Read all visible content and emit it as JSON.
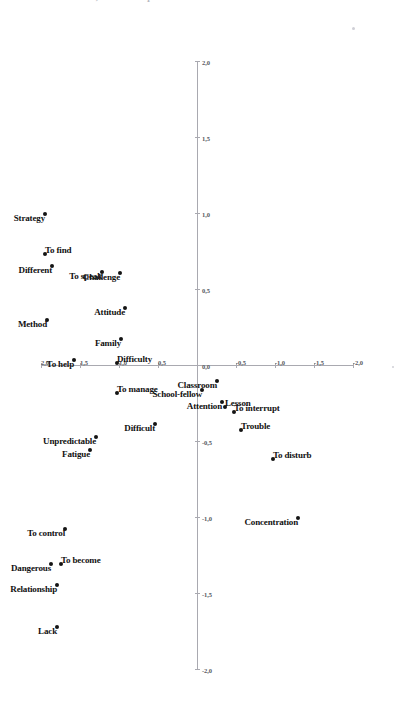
{
  "caption": {
    "text": "xxx. In the ideal, if I could qualified as mindful"
  },
  "chart_data": {
    "type": "scatter",
    "title": "",
    "subtitle": "",
    "xlabel": "",
    "ylabel": "",
    "grid": false,
    "legend": null,
    "xlim": [
      -2.0,
      2.0
    ],
    "ylim": [
      -2.0,
      2.0
    ],
    "xticks": [
      -2.0,
      -1.5,
      -1.0,
      -0.5,
      0.0,
      0.5,
      1.0,
      1.5,
      2.0
    ],
    "yticks": [
      -2.0,
      -1.5,
      -1.0,
      -0.5,
      0.0,
      0.5,
      1.0,
      1.5,
      2.0
    ],
    "xticklabels": [
      "-2,0",
      "-1,5",
      "-1,0",
      "-0,5",
      "0,0",
      "0,5",
      "1,0",
      "1,5",
      "2,0"
    ],
    "yticklabels": [
      "-2,0",
      "-1,5",
      "-1,0",
      "-0,5",
      "0,0",
      "0,5",
      "1,0",
      "1,5",
      "2,0"
    ],
    "points": [
      {
        "label": "Lack",
        "x": -1.72,
        "y": 1.8,
        "side": "left"
      },
      {
        "label": "Relationship",
        "x": -1.44,
        "y": 1.8,
        "side": "left"
      },
      {
        "label": "Dangerous",
        "x": -1.3,
        "y": 1.87,
        "side": "left"
      },
      {
        "label": "To become",
        "x": -1.3,
        "y": 1.74,
        "side": "right"
      },
      {
        "label": "To control",
        "x": -1.07,
        "y": 1.69,
        "side": "left"
      },
      {
        "label": "Fatigue",
        "x": -0.55,
        "y": 1.37,
        "side": "left"
      },
      {
        "label": "Unpredictable",
        "x": -0.47,
        "y": 1.29,
        "side": "left"
      },
      {
        "label": "Difficult",
        "x": -0.38,
        "y": 0.54,
        "side": "left"
      },
      {
        "label": "To manage",
        "x": -0.18,
        "y": 1.02,
        "side": "right"
      },
      {
        "label": "Difficulty",
        "x": 0.02,
        "y": 1.02,
        "side": "right"
      },
      {
        "label": "To help",
        "x": 0.04,
        "y": 1.58,
        "side": "left"
      },
      {
        "label": "Method",
        "x": 0.3,
        "y": 1.92,
        "side": "left"
      },
      {
        "label": "Different",
        "x": 0.66,
        "y": 1.86,
        "side": "left"
      },
      {
        "label": "To find",
        "x": 0.74,
        "y": 1.95,
        "side": "right"
      },
      {
        "label": "Strategy",
        "x": 1.0,
        "y": 1.95,
        "side": "left"
      },
      {
        "label": "Family",
        "x": 0.18,
        "y": 0.97,
        "side": "left"
      },
      {
        "label": "Attitude",
        "x": 0.38,
        "y": 0.92,
        "side": "left"
      },
      {
        "label": "Challenge",
        "x": 0.61,
        "y": 0.99,
        "side": "left"
      },
      {
        "label": "To speak",
        "x": 0.62,
        "y": 1.22,
        "side": "left"
      },
      {
        "label": "School-fellow",
        "x": -0.16,
        "y": -0.07,
        "side": "left"
      },
      {
        "label": "Classroom",
        "x": -0.1,
        "y": -0.25,
        "side": "left"
      },
      {
        "label": "Attention",
        "x": -0.24,
        "y": -0.32,
        "side": "left"
      },
      {
        "label": "Lesson",
        "x": -0.27,
        "y": -0.36,
        "side": "right"
      },
      {
        "label": "To interrupt",
        "x": -0.3,
        "y": -0.47,
        "side": "right"
      },
      {
        "label": "Trouble",
        "x": -0.42,
        "y": -0.56,
        "side": "right"
      },
      {
        "label": "To disturb",
        "x": -0.61,
        "y": -0.97,
        "side": "right"
      },
      {
        "label": "Concentration",
        "x": -1.0,
        "y": -1.3,
        "side": "left"
      }
    ]
  },
  "axes": {
    "horizontal_axis_name": "dimension-1-axis",
    "vertical_axis_name": "dimension-2-axis"
  }
}
